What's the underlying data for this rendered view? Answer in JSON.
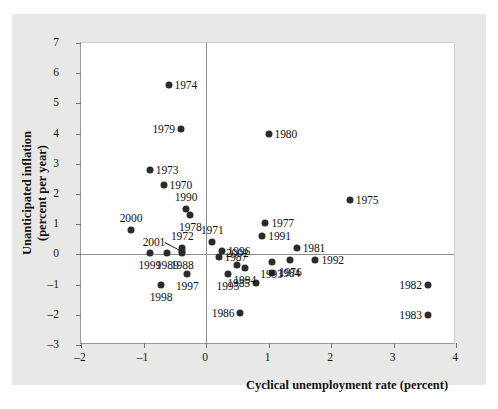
{
  "figure": {
    "background_color": "#e8e8e6",
    "plot_background_color": "#ffffff",
    "dot_color": "#2b2b2b",
    "axis_color": "#8e8e8e"
  },
  "chart_data": {
    "type": "scatter",
    "title": "",
    "xlabel": "Cyclical unemployment rate (percent)",
    "ylabel": "Unanticipated inflation\n(percent per year)",
    "ylabel_line1": "Unanticipated inflation",
    "ylabel_line2": "(percent per year)",
    "xlim": [
      -2,
      4
    ],
    "ylim": [
      -3,
      7
    ],
    "xticks": [
      -2,
      -1,
      0,
      1,
      2,
      3,
      4
    ],
    "xtick_labels": [
      "–2",
      "–1",
      "0",
      "1",
      "2",
      "3",
      "4"
    ],
    "yticks": [
      -3,
      -2,
      -1,
      0,
      1,
      2,
      3,
      4,
      5,
      6,
      7
    ],
    "ytick_labels": [
      "–3",
      "–2",
      "–1",
      "0",
      "1",
      "2",
      "3",
      "4",
      "5",
      "6",
      "7"
    ],
    "grid": false,
    "legend": "none",
    "zero_lines": true,
    "points": [
      {
        "label": "1970",
        "x": -0.68,
        "y": 2.3,
        "label_pos": "right"
      },
      {
        "label": "1971",
        "x": 0.1,
        "y": 0.42,
        "label_pos": "above"
      },
      {
        "label": "1972",
        "x": -0.38,
        "y": 0.2,
        "label_pos": "above"
      },
      {
        "label": "1973",
        "x": -0.9,
        "y": 2.8,
        "label_pos": "right"
      },
      {
        "label": "1974",
        "x": -0.6,
        "y": 5.6,
        "label_pos": "right"
      },
      {
        "label": "1975",
        "x": 2.3,
        "y": 1.8,
        "label_pos": "right"
      },
      {
        "label": "1976",
        "x": 1.35,
        "y": -0.18,
        "label_pos": "below"
      },
      {
        "label": "1977",
        "x": 0.95,
        "y": 1.05,
        "label_pos": "right"
      },
      {
        "label": "1978",
        "x": -0.25,
        "y": 1.3,
        "label_pos": "below"
      },
      {
        "label": "1979",
        "x": -0.4,
        "y": 4.15,
        "label_pos": "left"
      },
      {
        "label": "1980",
        "x": 1.0,
        "y": 4.0,
        "label_pos": "right"
      },
      {
        "label": "1981",
        "x": 1.45,
        "y": 0.2,
        "label_pos": "right"
      },
      {
        "label": "1982",
        "x": 3.55,
        "y": -1.0,
        "label_pos": "left"
      },
      {
        "label": "1983",
        "x": 3.55,
        "y": -2.0,
        "label_pos": "left"
      },
      {
        "label": "1984",
        "x": 1.05,
        "y": -0.6,
        "label_pos": "right"
      },
      {
        "label": "1985",
        "x": 0.8,
        "y": -0.95,
        "label_pos": "left"
      },
      {
        "label": "1986",
        "x": 0.55,
        "y": -1.95,
        "label_pos": "left"
      },
      {
        "label": "1987",
        "x": 0.2,
        "y": -0.08,
        "label_pos": "right"
      },
      {
        "label": "1988",
        "x": -0.38,
        "y": 0.03,
        "label_pos": "below"
      },
      {
        "label": "1989",
        "x": -0.62,
        "y": 0.03,
        "label_pos": "below"
      },
      {
        "label": "1990",
        "x": -0.32,
        "y": 1.5,
        "label_pos": "above"
      },
      {
        "label": "1991",
        "x": 0.9,
        "y": 0.6,
        "label_pos": "right"
      },
      {
        "label": "1992",
        "x": 1.75,
        "y": -0.2,
        "label_pos": "right"
      },
      {
        "label": "1993",
        "x": 1.05,
        "y": -0.25,
        "label_pos": "below"
      },
      {
        "label": "1994",
        "x": 0.62,
        "y": -0.45,
        "label_pos": "below"
      },
      {
        "label": "1995",
        "x": 0.35,
        "y": -0.65,
        "label_pos": "below"
      },
      {
        "label": "1996",
        "x": 0.25,
        "y": 0.12,
        "label_pos": "right"
      },
      {
        "label": "1997",
        "x": -0.3,
        "y": -0.65,
        "label_pos": "below"
      },
      {
        "label": "1998",
        "x": -0.72,
        "y": -1.0,
        "label_pos": "below"
      },
      {
        "label": "1999",
        "x": -0.9,
        "y": 0.03,
        "label_pos": "below"
      },
      {
        "label": "2000",
        "x": -1.2,
        "y": 0.82,
        "label_pos": "above"
      },
      {
        "label": "2001",
        "x": -0.38,
        "y": 0.12,
        "label_pos": "leader-left"
      },
      {
        "label": "2002",
        "x": 0.5,
        "y": -0.35,
        "label_pos": "above"
      }
    ]
  }
}
